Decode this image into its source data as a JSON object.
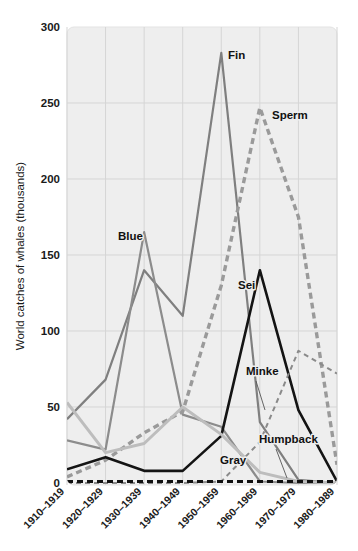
{
  "chart_data": {
    "type": "line",
    "title": "",
    "xlabel": "",
    "ylabel": "World catches of whales (thousands)",
    "ylim": [
      0,
      300
    ],
    "yticks": [
      0,
      50,
      100,
      150,
      200,
      250,
      300
    ],
    "ytick_labels": [
      "0",
      "50",
      "100",
      "150",
      "200",
      "250",
      "300"
    ],
    "grid": true,
    "legend_position": "inline-labels",
    "categories": [
      "1910–1919",
      "1920–1929",
      "1930–1939",
      "1940–1949",
      "1950–1959",
      "1960–1969",
      "1970–1979",
      "1980–1989"
    ],
    "series": [
      {
        "name": "Fin",
        "label": "Fin",
        "color": "#7f7f7f",
        "style": "solid",
        "width": 2.2,
        "values": [
          42,
          68,
          140,
          110,
          283,
          40,
          2,
          0
        ],
        "label_x": 228,
        "label_y": 59
      },
      {
        "name": "Blue",
        "label": "Blue",
        "color": "#8c8c8c",
        "style": "solid",
        "width": 2.2,
        "values": [
          28,
          22,
          165,
          45,
          37,
          1,
          0,
          0
        ],
        "label_x": 118,
        "label_y": 240
      },
      {
        "name": "Sperm",
        "label": "Sperm",
        "color": "#9a9a9a",
        "style": "dashed-thick",
        "width": 3.4,
        "values": [
          4,
          15,
          33,
          47,
          130,
          247,
          175,
          12
        ],
        "label_x": 272,
        "label_y": 119
      },
      {
        "name": "Sei",
        "label": "Sei",
        "color": "#141414",
        "style": "solid",
        "width": 2.6,
        "values": [
          9,
          17,
          8,
          8,
          31,
          140,
          48,
          1
        ],
        "label_x": 238,
        "label_y": 289
      },
      {
        "name": "Minke",
        "label": "Minke",
        "color": "#8a8a8a",
        "style": "dashed-thin",
        "width": 2.0,
        "values": [
          0,
          0,
          0,
          0,
          1,
          27,
          87,
          72
        ],
        "label_x": 246,
        "label_y": 375
      },
      {
        "name": "Humpback",
        "label": "Humpback",
        "color": "#bdbdbd",
        "style": "solid",
        "width": 3.0,
        "values": [
          53,
          20,
          26,
          50,
          32,
          7,
          1,
          0
        ],
        "label_x": 259,
        "label_y": 443
      },
      {
        "name": "Gray",
        "label": "Gray",
        "color": "#111111",
        "style": "dashed-thick",
        "width": 3.2,
        "values": [
          1,
          1,
          1,
          1,
          1,
          1,
          1,
          1
        ],
        "label_x": 220,
        "label_y": 464
      }
    ],
    "annotations": [
      {
        "name": "minke-leader",
        "x1": 256,
        "x2": 265,
        "y1": 381,
        "y2": 410
      },
      {
        "name": "humpback-leader",
        "x1": 276,
        "x2": 287,
        "y1": 449,
        "y2": 478
      }
    ]
  }
}
